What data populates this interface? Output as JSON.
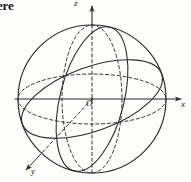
{
  "figure": {
    "kind": "geometry-diagram",
    "title_fragment": "ere",
    "background_color": "#fdfdfc",
    "ink_color": "#2b2b2b",
    "labels": {
      "z_axis": "z",
      "x_axis": "x",
      "y_axis": "y",
      "origin": "O"
    },
    "axes": [
      {
        "name": "x-axis",
        "label": "x",
        "direction": "right",
        "style": "solid",
        "arrow": true,
        "from": [
          15,
          99
        ],
        "to": [
          184,
          99
        ]
      },
      {
        "name": "z-axis",
        "label": "z",
        "direction": "up",
        "style": "dashed-inside-solid-outside",
        "arrow": true,
        "from": [
          92,
          178
        ],
        "to": [
          92,
          5
        ]
      },
      {
        "name": "y-axis",
        "label": "y",
        "direction": "down-left",
        "style": "dashed",
        "arrow": true,
        "from": [
          92,
          99
        ],
        "to": [
          25,
          171
        ]
      }
    ],
    "curves": [
      {
        "name": "sphere-outline",
        "type": "circle",
        "style": "solid",
        "center": [
          92,
          99
        ],
        "radius": 74
      },
      {
        "name": "equator",
        "type": "ellipse",
        "style": "dashed",
        "center": [
          92,
          99
        ],
        "rx": 74,
        "ry": 25
      },
      {
        "name": "meridian-xz-front",
        "type": "ellipse",
        "style": "dashed",
        "center": [
          92,
          99
        ],
        "rx": 30,
        "ry": 74
      },
      {
        "name": "great-circle-tilted",
        "type": "ellipse",
        "style": "solid",
        "center": [
          92,
          99
        ],
        "rx": 74,
        "ry": 32,
        "rotation_deg": -22
      },
      {
        "name": "great-circle-left-meridian",
        "type": "ellipse",
        "style": "solid",
        "center": [
          92,
          99
        ],
        "rx": 32,
        "ry": 74,
        "rotation_deg": 16
      }
    ],
    "origin_point": [
      92,
      99
    ]
  }
}
